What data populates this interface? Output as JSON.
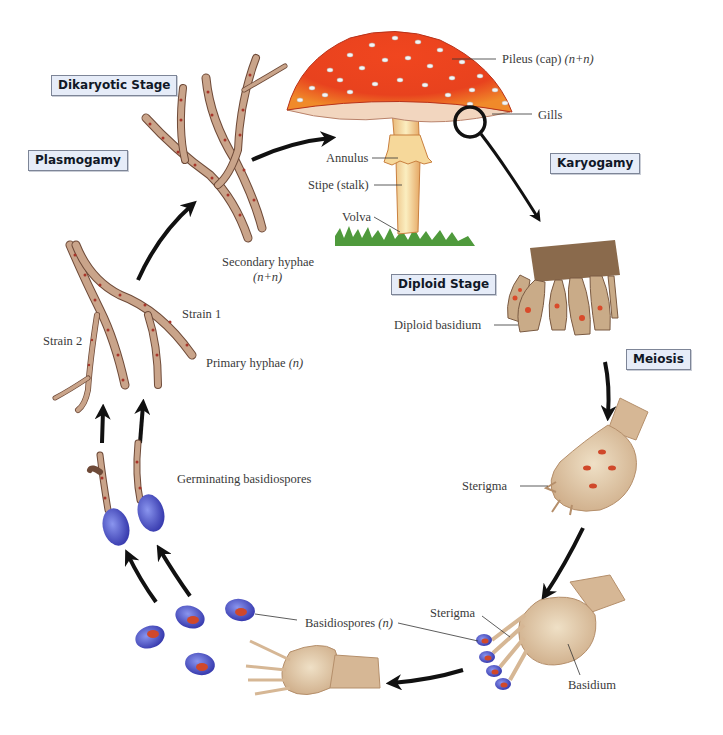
{
  "diagram": {
    "colors": {
      "stage_box_fill": "#e6ecf8",
      "stage_box_border": "#7d8597",
      "arrow": "#111111",
      "cap_red": "#e8421e",
      "hyphae": "#c9a48a",
      "nucleus": "#b7372a",
      "spore_blue": "#4a4fc4",
      "basidium": "#d6b795",
      "grass": "#4f9a3c"
    },
    "stages": [
      {
        "id": "dikaryotic",
        "label": "Dikaryotic Stage"
      },
      {
        "id": "plasmogamy",
        "label": "Plasmogamy"
      },
      {
        "id": "karyogamy",
        "label": "Karyogamy"
      },
      {
        "id": "diploid",
        "label": "Diploid Stage"
      },
      {
        "id": "meiosis",
        "label": "Meiosis"
      }
    ],
    "labels": {
      "pileus": "Pileus (cap)",
      "pileus_ploidy": "(n+n)",
      "gills": "Gills",
      "annulus": "Annulus",
      "stipe": "Stipe (stalk)",
      "volva": "Volva",
      "secondary_hyphae": "Secondary hyphae",
      "secondary_hyphae_ploidy": "(n+n)",
      "strain1": "Strain 1",
      "strain2": "Strain 2",
      "primary_hyphae": "Primary hyphae",
      "primary_hyphae_ploidy": "(n)",
      "diploid_basidium": "Diploid basidium",
      "sterigma_upper": "Sterigma",
      "germinating": "Germinating basidiospores",
      "basidiospores": "Basidiospores",
      "basidiospores_ploidy": "(n)",
      "sterigma_lower": "Sterigma",
      "basidium": "Basidium"
    }
  }
}
